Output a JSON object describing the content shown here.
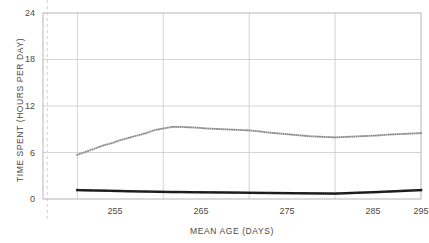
{
  "chart_data": {
    "type": "line",
    "title": "",
    "xlabel": "MEAN AGE (DAYS)",
    "ylabel": "TIME SPENT (HOURS PER DAY)",
    "xlim": [
      251,
      295
    ],
    "ylim": [
      0,
      24
    ],
    "xticks": [
      "255",
      "265",
      "275",
      "285",
      "295"
    ],
    "xtick_values": [
      255,
      265,
      275,
      285,
      295
    ],
    "yticks": [
      "0",
      "6",
      "12",
      "18",
      "24"
    ],
    "ytick_values": [
      0,
      6,
      12,
      18,
      24
    ],
    "grid": true,
    "legend": "none",
    "annotations": [
      {
        "name": "vertical-dashed-reference-line",
        "x": 251.5,
        "style": "dashed",
        "color": "#d8d8d8"
      }
    ],
    "series": [
      {
        "name": "upper-dotted-series",
        "style": "dotted",
        "color": "#8a8a8a",
        "marker": "square-dot",
        "x": [
          255,
          256,
          257,
          258,
          259,
          260,
          261,
          262,
          263,
          264,
          265,
          266,
          267,
          268,
          269,
          270,
          271,
          272,
          273,
          274,
          275,
          276,
          277,
          278,
          279,
          280,
          281,
          282,
          283,
          284,
          285,
          286,
          287,
          288,
          289,
          290,
          291,
          292,
          293,
          294,
          295
        ],
        "y": [
          5.7,
          6.1,
          6.5,
          6.9,
          7.2,
          7.6,
          7.9,
          8.2,
          8.5,
          8.9,
          9.1,
          9.3,
          9.3,
          9.25,
          9.2,
          9.1,
          9.05,
          9.0,
          8.95,
          8.9,
          8.85,
          8.75,
          8.6,
          8.5,
          8.4,
          8.3,
          8.2,
          8.1,
          8.05,
          8.0,
          7.95,
          8.0,
          8.05,
          8.1,
          8.15,
          8.2,
          8.3,
          8.35,
          8.4,
          8.45,
          8.5
        ]
      },
      {
        "name": "lower-dotted-series",
        "style": "dotted",
        "color": "#1a1a1a",
        "marker": "square-dot",
        "x": [
          255,
          256,
          257,
          258,
          259,
          260,
          261,
          262,
          263,
          264,
          265,
          266,
          267,
          268,
          269,
          270,
          271,
          272,
          273,
          274,
          275,
          276,
          277,
          278,
          279,
          280,
          281,
          282,
          283,
          284,
          285,
          286,
          287,
          288,
          289,
          290,
          291,
          292,
          293,
          294,
          295
        ],
        "y": [
          1.15,
          1.12,
          1.1,
          1.08,
          1.05,
          1.03,
          1.0,
          0.98,
          0.96,
          0.94,
          0.92,
          0.9,
          0.9,
          0.88,
          0.87,
          0.86,
          0.85,
          0.84,
          0.83,
          0.82,
          0.8,
          0.79,
          0.78,
          0.77,
          0.76,
          0.75,
          0.74,
          0.73,
          0.72,
          0.71,
          0.7,
          0.74,
          0.78,
          0.82,
          0.86,
          0.9,
          0.95,
          1.0,
          1.05,
          1.1,
          1.15
        ]
      }
    ]
  }
}
